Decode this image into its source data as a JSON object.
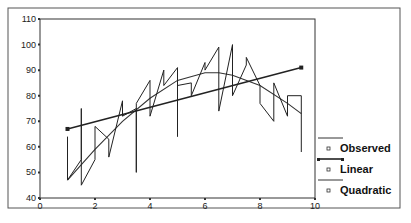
{
  "chart_data": {
    "type": "line",
    "title": "",
    "xlabel": "",
    "ylabel": "",
    "xlim": [
      0,
      10
    ],
    "ylim": [
      40,
      110
    ],
    "x_ticks": [
      0,
      2,
      4,
      6,
      8,
      10
    ],
    "y_ticks": [
      40,
      50,
      60,
      70,
      80,
      90,
      100,
      110
    ],
    "grid": false,
    "legend_position": "right-bottom",
    "legend": [
      "Observed",
      "Linear",
      "Quadratic"
    ],
    "series": [
      {
        "name": "Observed",
        "style": "zigzag-line",
        "points": [
          [
            1.0,
            64
          ],
          [
            1.0,
            47
          ],
          [
            1.5,
            55
          ],
          [
            1.5,
            75
          ],
          [
            1.5,
            45
          ],
          [
            2.0,
            55
          ],
          [
            2.0,
            68
          ],
          [
            2.5,
            63
          ],
          [
            2.5,
            56
          ],
          [
            3.0,
            78
          ],
          [
            3.0,
            72
          ],
          [
            3.5,
            75
          ],
          [
            3.5,
            50
          ],
          [
            3.5,
            77
          ],
          [
            4.0,
            86
          ],
          [
            4.0,
            72
          ],
          [
            4.5,
            90
          ],
          [
            4.5,
            84
          ],
          [
            5.0,
            91
          ],
          [
            5.0,
            64
          ],
          [
            5.0,
            84
          ],
          [
            5.5,
            85
          ],
          [
            5.5,
            80
          ],
          [
            6.0,
            93
          ],
          [
            6.0,
            90
          ],
          [
            6.5,
            99
          ],
          [
            6.5,
            74
          ],
          [
            7.0,
            100
          ],
          [
            7.0,
            80
          ],
          [
            7.5,
            92
          ],
          [
            7.5,
            95
          ],
          [
            8.0,
            84
          ],
          [
            8.0,
            77
          ],
          [
            8.5,
            70
          ],
          [
            8.5,
            85
          ],
          [
            9.0,
            72
          ],
          [
            9.0,
            80
          ],
          [
            9.5,
            80
          ],
          [
            9.5,
            58
          ]
        ]
      },
      {
        "name": "Linear",
        "style": "line-with-endpoints",
        "points": [
          [
            1.0,
            67
          ],
          [
            9.5,
            91
          ]
        ]
      },
      {
        "name": "Quadratic",
        "style": "smooth-line",
        "points": [
          [
            1.0,
            47
          ],
          [
            2.0,
            59
          ],
          [
            3.0,
            70
          ],
          [
            4.0,
            79
          ],
          [
            5.0,
            86
          ],
          [
            6.0,
            89
          ],
          [
            6.5,
            89
          ],
          [
            7.0,
            88
          ],
          [
            8.0,
            84
          ],
          [
            9.0,
            77
          ],
          [
            9.5,
            73
          ]
        ]
      }
    ]
  },
  "legend": {
    "items": [
      {
        "label": "Observed"
      },
      {
        "label": "Linear"
      },
      {
        "label": "Quadratic"
      }
    ]
  },
  "axes": {
    "x_tick_labels": [
      "0",
      "2",
      "4",
      "6",
      "8",
      "10"
    ],
    "y_tick_labels": [
      "40",
      "50",
      "60",
      "70",
      "80",
      "90",
      "100",
      "110"
    ]
  }
}
